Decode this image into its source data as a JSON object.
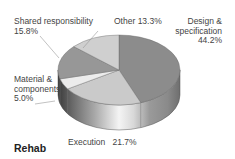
{
  "chart_data": {
    "type": "pie",
    "style": "3d",
    "title": "Rehab",
    "categories": [
      "Design & specification",
      "Execution",
      "Material & components",
      "Shared responsibility",
      "Other"
    ],
    "values": [
      44.2,
      21.7,
      5.0,
      15.8,
      13.3
    ],
    "colors": [
      "#8c8c8c",
      "#cacaca",
      "#ececec",
      "#979797",
      "#cfcfcf"
    ],
    "labels": [
      {
        "line1": "Design &",
        "line2": "specification",
        "line3": "44.2%"
      },
      {
        "line1": "Execution",
        "value": "21.7%"
      },
      {
        "line1": "Material &",
        "line2": "components",
        "line3": "5.0%"
      },
      {
        "line1": "Shared responsibility",
        "line2": "15.8%"
      },
      {
        "line1": "Other",
        "value": "13.3%"
      }
    ]
  }
}
